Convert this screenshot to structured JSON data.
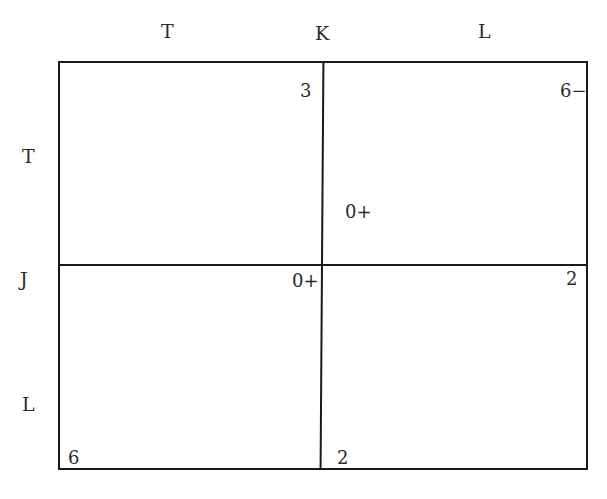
{
  "column_labels": [
    "T",
    "K",
    "L"
  ],
  "row_labels": [
    "T",
    "J",
    "L"
  ],
  "cells": {
    "top_left": "3",
    "top_right_corner": "6−",
    "top_right_inner": "0+",
    "bottom_left_top": "0+",
    "bottom_right_top": "2",
    "bottom_left_bottom": "6",
    "bottom_right_bottom": "2"
  }
}
